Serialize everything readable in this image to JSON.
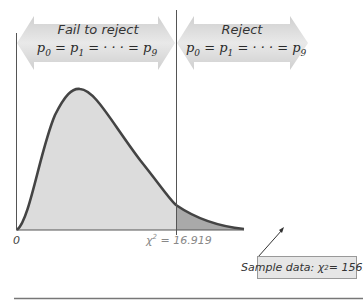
{
  "left_panel": {
    "title": "Fail to reject",
    "equation": {
      "p0": "p",
      "s0": "0",
      "p1": "p",
      "s1": "1",
      "mid": " = · · · = ",
      "p9": "p",
      "s9": "9",
      "eq1": " = "
    }
  },
  "right_panel": {
    "title": "Reject",
    "equation": {
      "p0": "p",
      "s0": "0",
      "p1": "p",
      "s1": "1",
      "mid": " = · · · = ",
      "p9": "p",
      "s9": "9",
      "eq1": " = "
    }
  },
  "axis": {
    "origin_label": "0"
  },
  "critical_value": {
    "symbol": "χ",
    "sup": "2",
    "text": " = 16.919"
  },
  "sample": {
    "prefix": "Sample data: ",
    "symbol": "χ",
    "sup": "2",
    "text": " = 156.5"
  },
  "colors": {
    "curve": "#444444",
    "fill_accept": "#dcdcdc",
    "fill_reject": "#a9a9a9",
    "arrow_band": "#c8c8c8",
    "box": "#e6e6e6"
  }
}
